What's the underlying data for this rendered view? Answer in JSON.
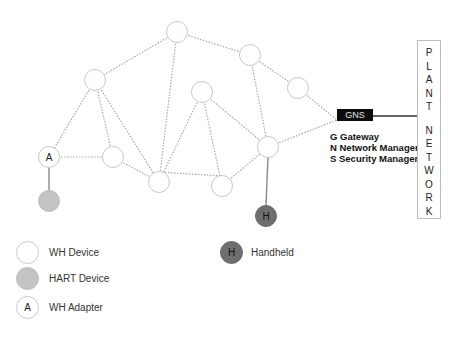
{
  "nodes": [
    {
      "id": "n1",
      "x": 177,
      "y": 32,
      "type": "wh",
      "label": ""
    },
    {
      "id": "n2",
      "x": 250,
      "y": 55,
      "type": "wh",
      "label": ""
    },
    {
      "id": "n3",
      "x": 298,
      "y": 88,
      "type": "wh",
      "label": ""
    },
    {
      "id": "n4",
      "x": 95,
      "y": 80,
      "type": "wh",
      "label": ""
    },
    {
      "id": "n5",
      "x": 202,
      "y": 92,
      "type": "wh",
      "label": ""
    },
    {
      "id": "n6",
      "x": 49,
      "y": 157,
      "type": "adapter",
      "label": "A"
    },
    {
      "id": "n7",
      "x": 113,
      "y": 157,
      "type": "wh",
      "label": ""
    },
    {
      "id": "n8",
      "x": 159,
      "y": 182,
      "type": "wh",
      "label": ""
    },
    {
      "id": "n9",
      "x": 222,
      "y": 186,
      "type": "wh",
      "label": ""
    },
    {
      "id": "n10",
      "x": 268,
      "y": 147,
      "type": "wh",
      "label": ""
    },
    {
      "id": "n11",
      "x": 49,
      "y": 201,
      "type": "hart",
      "label": ""
    },
    {
      "id": "n12",
      "x": 266,
      "y": 216,
      "type": "handheld",
      "label": "H"
    }
  ],
  "gns": {
    "label": "GNS"
  },
  "key": {
    "line1": "G Gateway",
    "line2": "N Network Manager",
    "line3": "S Security Manager"
  },
  "plant_network": {
    "letters": [
      "P",
      "L",
      "A",
      "N",
      "T",
      "",
      "N",
      "E",
      "T",
      "W",
      "O",
      "R",
      "K"
    ]
  },
  "legend": {
    "wh_device": "WH Device",
    "hart_device": "HART Device",
    "wh_adapter": "WH Adapter",
    "wh_adapter_glyph": "A",
    "handheld": "Handheld",
    "handheld_glyph": "H"
  },
  "colors": {
    "mesh_link": "#a8a8a8",
    "wired_link": "#8a8a8a",
    "hart_fill": "#c4c4c4",
    "handheld_fill": "#6e6e6e",
    "gns_fill": "#0c0c0c"
  }
}
